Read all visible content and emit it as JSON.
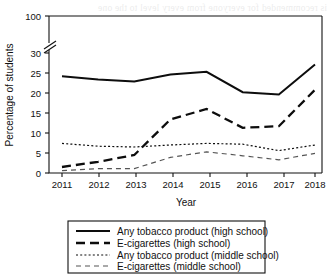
{
  "chart_data": {
    "type": "line",
    "title": "",
    "xlabel": "Year",
    "ylabel": "Percentage of students",
    "x": [
      2011,
      2012,
      2013,
      2014,
      2015,
      2016,
      2017,
      2018
    ],
    "xtick_labels": [
      "2011",
      "2012",
      "2013",
      "2014",
      "2015",
      "2016",
      "2017",
      "2018"
    ],
    "ytick_labels": [
      "0",
      "5",
      "10",
      "15",
      "20",
      "25",
      "30",
      "100"
    ],
    "ytick_values": [
      0,
      5,
      10,
      15,
      20,
      25,
      30,
      100
    ],
    "ylim": [
      0,
      100
    ],
    "axis_break": {
      "present": true,
      "between": [
        30,
        100
      ],
      "style": "double-slash"
    },
    "grid": false,
    "legend_position": "below-axes",
    "series": [
      {
        "name": "Any tobacco product (high school)",
        "style": "solid",
        "values": [
          24.2,
          23.4,
          22.9,
          24.6,
          25.3,
          20.2,
          19.6,
          27.1
        ]
      },
      {
        "name": "E-cigarettes (high school)",
        "style": "long-dash",
        "values": [
          1.5,
          2.8,
          4.5,
          13.4,
          16.0,
          11.3,
          11.7,
          20.8
        ]
      },
      {
        "name": "Any tobacco product (middle school)",
        "style": "dotted",
        "values": [
          7.4,
          6.7,
          6.5,
          7.0,
          7.4,
          7.2,
          5.6,
          7.0
        ]
      },
      {
        "name": "E-cigarettes (middle school)",
        "style": "short-dash",
        "values": [
          0.6,
          1.1,
          1.1,
          3.9,
          5.3,
          4.3,
          3.3,
          4.9
        ]
      }
    ]
  },
  "legend": {
    "entries": [
      {
        "label": "Any tobacco product (high school)"
      },
      {
        "label": "E-cigarettes (high school)"
      },
      {
        "label": "Any tobacco product (middle school)"
      },
      {
        "label": "E-cigarettes (middle school)"
      }
    ]
  },
  "bleed_text": "is recommended for everyone from every level to the one"
}
